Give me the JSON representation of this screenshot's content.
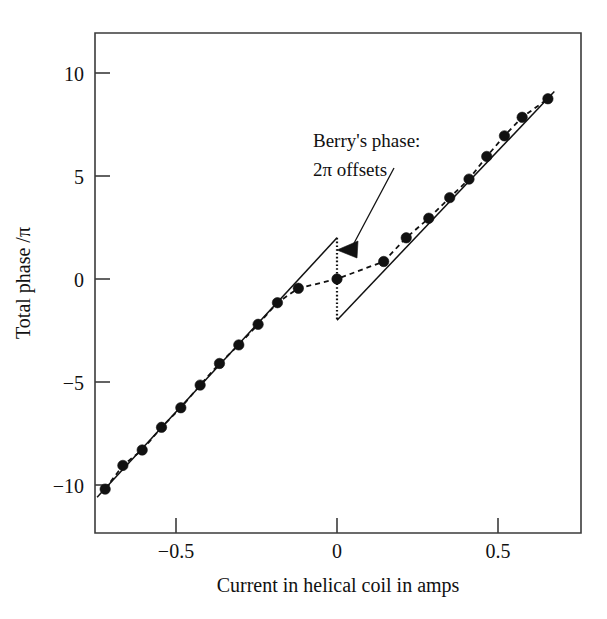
{
  "chart_data": {
    "type": "scatter",
    "title": "",
    "xlabel": "Current in helical coil in amps",
    "ylabel": "Total phase /π",
    "xlim": [
      -0.76,
      0.76
    ],
    "ylim": [
      -11.8,
      11.9
    ],
    "xticks": [
      -0.5,
      0,
      0.5
    ],
    "xticklabels": [
      "−0.5",
      "0",
      "0.5"
    ],
    "yticks": [
      10,
      5,
      0,
      -5,
      -10
    ],
    "yticklabels": [
      "10",
      "5",
      "0",
      "−5",
      "−10"
    ],
    "grid": false,
    "legend": null,
    "series": [
      {
        "name": "Measured total phase (dashed curve with filled circles)",
        "style": "dashed-with-markers",
        "marker": "filled-circle",
        "x": [
          -0.72,
          -0.665,
          -0.605,
          -0.545,
          -0.485,
          -0.425,
          -0.365,
          -0.305,
          -0.245,
          -0.185,
          -0.12,
          0.0,
          0.145,
          0.215,
          0.285,
          0.35,
          0.41,
          0.465,
          0.52,
          0.575,
          0.655
        ],
        "y": [
          -10.2,
          -9.05,
          -8.3,
          -7.2,
          -6.25,
          -5.15,
          -4.1,
          -3.2,
          -2.2,
          -1.15,
          -0.45,
          0.0,
          0.85,
          2.0,
          2.95,
          3.95,
          4.85,
          5.95,
          6.95,
          7.85,
          8.75
        ]
      },
      {
        "name": "Dynamic phase straight line, negative current branch",
        "style": "solid",
        "x": [
          -0.745,
          0.0
        ],
        "y": [
          -10.6,
          2.0
        ]
      },
      {
        "name": "Dynamic phase straight line, positive current branch",
        "style": "solid",
        "x": [
          0.0,
          0.675
        ],
        "y": [
          -2.0,
          9.1
        ]
      }
    ],
    "annotations": [
      {
        "name": "berry-phase-annotation",
        "lines": [
          "Berry's phase:",
          "2π offsets"
        ],
        "text_x": 0.12,
        "text_y": 7.3,
        "points_to_x": 0.0,
        "points_to_y": 1.45,
        "arrow": "triangle-left"
      },
      {
        "name": "two-pi-jump",
        "description": "vertical dotted discontinuity at zero current",
        "x": 0.0,
        "y_top": 2.0,
        "y_bottom": -2.0
      }
    ]
  },
  "axes": {
    "x_title": "Current in helical coil in amps",
    "y_title": "Total phase /π",
    "x_tick_labels": [
      "−0.5",
      "0",
      "0.5"
    ],
    "y_tick_labels": [
      "10",
      "5",
      "0",
      "−5",
      "−10"
    ]
  },
  "annotation": {
    "line1": "Berry's phase:",
    "line2": "2π offsets"
  },
  "colors": {
    "ink": "#111111",
    "frame": "#3b3b3b",
    "background": "#ffffff"
  }
}
